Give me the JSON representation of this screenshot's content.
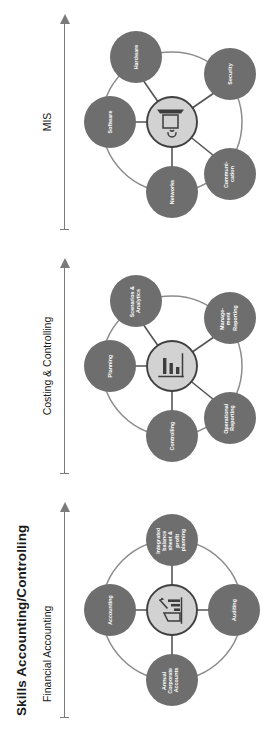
{
  "document": {
    "title": "Skills Accounting/Controlling",
    "orientation": "rotated-90-ccw"
  },
  "colors": {
    "satellite_fill": "#6e6e6e",
    "hub_fill": "#d2d2d2",
    "hub_stroke": "#3f3f3f",
    "ring_stroke": "#8c8c8c",
    "spoke_stroke": "#555555",
    "label_text": "#ffffff",
    "heading_text": "#1a1a1a",
    "axis": "#7a7a7a"
  },
  "clusters": [
    {
      "id": "financial-accounting",
      "title": "Financial Accounting",
      "hub_icon": "building-chart-pen-icon",
      "layout": "cross",
      "nodes": [
        {
          "id": "accounting",
          "label": "Accounting",
          "lines": [
            "Accounting"
          ],
          "position": "top"
        },
        {
          "id": "integrated-balance-sheet-profit-planning",
          "label": "Integrated balance sheet & profit planning",
          "lines": [
            "Integrated",
            "balance",
            "sheet &",
            "profit",
            "planning"
          ],
          "position": "right"
        },
        {
          "id": "auditing",
          "label": "Auditing",
          "lines": [
            "Auditing"
          ],
          "position": "bottom"
        },
        {
          "id": "annual-corporate-accounts",
          "label": "Annual Corporate Accounts",
          "lines": [
            "Annual",
            "Corporate",
            "Accounts"
          ],
          "position": "left"
        }
      ]
    },
    {
      "id": "costing-and-controlling",
      "title": "Costing & Controlling",
      "hub_icon": "bar-chart-icon",
      "layout": "pentagon",
      "nodes": [
        {
          "id": "planning",
          "label": "Planning",
          "lines": [
            "Planning"
          ],
          "position": "top"
        },
        {
          "id": "scenarios-and-analytics",
          "label": "Scenarios & Analytics",
          "lines": [
            "Scenarios &",
            "Analytics"
          ],
          "position": "upper-right"
        },
        {
          "id": "management-reporting",
          "label": "Management Reporting",
          "lines": [
            "Manage-",
            "ment",
            "Reporting"
          ],
          "position": "lower-right"
        },
        {
          "id": "operational-reporting",
          "label": "Operational Reporting",
          "lines": [
            "Operational",
            "Reporting"
          ],
          "position": "lower-left"
        },
        {
          "id": "controlling",
          "label": "Controlling",
          "lines": [
            "Controlling"
          ],
          "position": "upper-left"
        }
      ]
    },
    {
      "id": "mis",
      "title": "MIS",
      "hub_icon": "monitor-wifi-icon",
      "layout": "pentagon",
      "nodes": [
        {
          "id": "software",
          "label": "Software",
          "lines": [
            "Software"
          ],
          "position": "top"
        },
        {
          "id": "hardware",
          "label": "Hardware",
          "lines": [
            "Hardware"
          ],
          "position": "upper-right"
        },
        {
          "id": "security",
          "label": "Security",
          "lines": [
            "Security"
          ],
          "position": "lower-right"
        },
        {
          "id": "communication",
          "label": "Communication",
          "lines": [
            "Communi-",
            "cation"
          ],
          "position": "lower-left"
        },
        {
          "id": "networks",
          "label": "Networks",
          "lines": [
            "Networks"
          ],
          "position": "upper-left"
        }
      ]
    }
  ]
}
